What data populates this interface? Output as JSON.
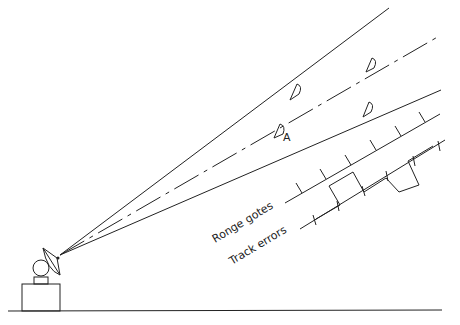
{
  "diagram": {
    "labels": {
      "range_gates": "Ronge gotes",
      "track_errors": "Track errors",
      "target_a": "A"
    },
    "elements": {
      "antenna": "radar dish on pedestal",
      "beam": "three beam lines (upper edge, dash-dot centerline, lower edge)",
      "targets": 4,
      "range_gate_ticks": 6
    }
  }
}
